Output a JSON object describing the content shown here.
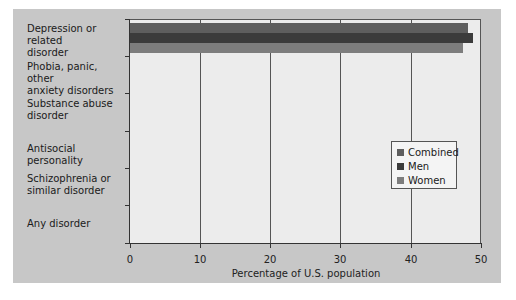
{
  "chart_data": {
    "type": "bar",
    "orientation": "horizontal",
    "title": "",
    "xlabel": "Percentage of U.S. population",
    "ylabel": "",
    "xlim": [
      0,
      50
    ],
    "xticks": [
      "0",
      "10",
      "20",
      "30",
      "40",
      "50"
    ],
    "grid": "vertical",
    "legend_position": "right, inside plot",
    "categories": [
      "Depression or related disorder",
      "Phobia, panic, other anxiety disorders",
      "Substance abuse disorder",
      "Antisocial personality",
      "Schizophrenia or similar disorder",
      "Any disorder"
    ],
    "series": [
      {
        "name": "Combined",
        "color": "#5e5e5e",
        "values": [
          19.5,
          25.6,
          27.3,
          3.5,
          1.1,
          48.1
        ]
      },
      {
        "name": "Men",
        "color": "#3b3b3b",
        "values": [
          14.5,
          19.5,
          35.1,
          5.3,
          0.9,
          48.9
        ]
      },
      {
        "name": "Women",
        "color": "#7d7d7d",
        "values": [
          24.8,
          30.7,
          18.6,
          1.4,
          1.1,
          47.4
        ]
      }
    ]
  },
  "labels": {
    "cat0_line1": "Depression or related",
    "cat0_line2": "disorder",
    "cat1_line1": "Phobia, panic, other",
    "cat1_line2": "anxiety disorders",
    "cat2_line1": "Substance abuse",
    "cat2_line2": "disorder",
    "cat3_line1": "Antisocial personality",
    "cat4_line1": "Schizophrenia or",
    "cat4_line2": "similar disorder",
    "cat5_line1": "Any disorder",
    "x0": "0",
    "x1": "10",
    "x2": "20",
    "x3": "30",
    "x4": "40",
    "x5": "50",
    "legend0": "Combined",
    "legend1": "Men",
    "legend2": "Women"
  }
}
